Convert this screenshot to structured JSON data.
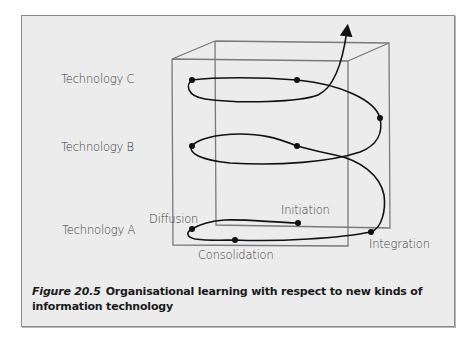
{
  "figure": {
    "number": "Figure 20.5",
    "caption": "Organisational learning with respect to new kinds of information technology"
  },
  "levels": [
    {
      "label": "Technology C"
    },
    {
      "label": "Technology B"
    },
    {
      "label": "Technology A"
    }
  ],
  "stages": {
    "diffusion": "Diffusion",
    "initiation": "Initiation",
    "integration": "Integration",
    "consolidation": "Consolidation"
  },
  "colors": {
    "background": "#ececec",
    "box_line": "#7a7a7a",
    "curve": "#111111",
    "label_text": "#3a3a3a",
    "caption_text": "#1a1a1a"
  }
}
